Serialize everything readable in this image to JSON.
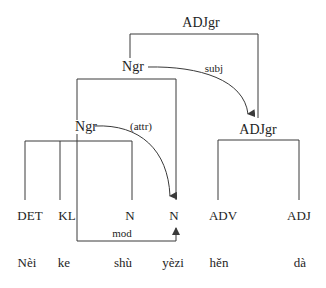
{
  "diagram": {
    "type": "syntax-dependency-tree",
    "nodes": {
      "root": "ADJgr",
      "ngr_top": "Ngr",
      "ngr_inner": "Ngr",
      "adjgr_inner": "ADJgr"
    },
    "relations": {
      "subj": "subj",
      "attr": "(attr)",
      "mod": "mod"
    },
    "categories": [
      "DET",
      "KL",
      "N",
      "N",
      "ADV",
      "ADJ"
    ],
    "words": [
      "Nèi",
      "ke",
      "shù",
      "yèzi",
      "hěn",
      "dà"
    ],
    "colors": {
      "line": "#3a3a3a",
      "text": "#1e1e1e",
      "background": "#ffffff"
    }
  }
}
